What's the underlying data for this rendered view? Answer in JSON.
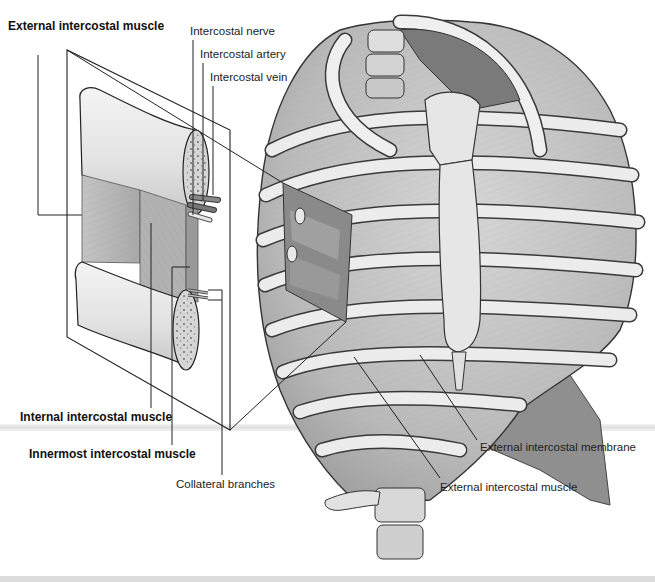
{
  "figure": {
    "colors": {
      "background": "#ffffff",
      "bone": "#e6e6e6",
      "muscle": "#b8b8b8",
      "muscle_dark": "#8c8c8c",
      "outline": "#333333",
      "leader_line": "#222222"
    }
  },
  "labels": {
    "external_intercostal_muscle_inset": "External intercostal muscle",
    "intercostal_nerve": "Intercostal nerve",
    "intercostal_artery": "Intercostal artery",
    "intercostal_vein": "Intercostal vein",
    "internal_intercostal_muscle": "Internal intercostal muscle",
    "innermost_intercostal_muscle": "Innermost intercostal muscle",
    "collateral_branches": "Collateral branches",
    "external_intercostal_membrane": "External intercostal membrane",
    "external_intercostal_muscle": "External intercostal muscle"
  }
}
